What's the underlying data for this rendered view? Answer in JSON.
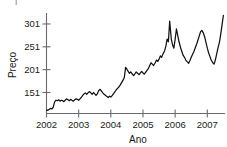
{
  "chart_data": {
    "type": "line",
    "title": "",
    "xlabel": "Ano",
    "ylabel": "Preço",
    "xlim": [
      2002.0,
      2007.55
    ],
    "ylim": [
      105,
      325
    ],
    "grid": false,
    "legend": null,
    "x_ticks": [
      2002,
      2003,
      2004,
      2005,
      2006,
      2007
    ],
    "x_tick_labels": [
      "2002",
      "2003",
      "2004",
      "2005",
      "2006",
      "2007"
    ],
    "y_ticks": [
      151,
      201,
      251,
      301
    ],
    "y_tick_labels": [
      "151",
      "201",
      "251",
      "301"
    ],
    "series": [
      {
        "name": "Preço",
        "color": "#121212",
        "marker": "none",
        "x": [
          2002.0,
          2002.04,
          2002.08,
          2002.12,
          2002.17,
          2002.21,
          2002.25,
          2002.29,
          2002.33,
          2002.38,
          2002.42,
          2002.46,
          2002.5,
          2002.54,
          2002.58,
          2002.62,
          2002.67,
          2002.71,
          2002.75,
          2002.79,
          2002.83,
          2002.88,
          2002.92,
          2002.96,
          2003.0,
          2003.04,
          2003.08,
          2003.12,
          2003.17,
          2003.21,
          2003.25,
          2003.29,
          2003.33,
          2003.38,
          2003.42,
          2003.46,
          2003.5,
          2003.54,
          2003.58,
          2003.62,
          2003.67,
          2003.71,
          2003.75,
          2003.79,
          2003.83,
          2003.88,
          2003.92,
          2003.96,
          2004.0,
          2004.04,
          2004.08,
          2004.12,
          2004.17,
          2004.21,
          2004.25,
          2004.29,
          2004.33,
          2004.38,
          2004.42,
          2004.46,
          2004.5,
          2004.54,
          2004.58,
          2004.62,
          2004.67,
          2004.71,
          2004.75,
          2004.79,
          2004.83,
          2004.88,
          2004.92,
          2004.96,
          2005.0,
          2005.04,
          2005.08,
          2005.12,
          2005.17,
          2005.21,
          2005.25,
          2005.29,
          2005.33,
          2005.38,
          2005.42,
          2005.46,
          2005.5,
          2005.54,
          2005.58,
          2005.62,
          2005.67,
          2005.71,
          2005.75,
          2005.79,
          2005.83,
          2005.88,
          2005.92,
          2005.96,
          2006.0,
          2006.04,
          2006.08,
          2006.12,
          2006.17,
          2006.21,
          2006.25,
          2006.29,
          2006.33,
          2006.38,
          2006.42,
          2006.46,
          2006.5,
          2006.54,
          2006.58,
          2006.62,
          2006.67,
          2006.71,
          2006.75,
          2006.79,
          2006.83,
          2006.88,
          2006.92,
          2006.96,
          2007.0,
          2007.04,
          2007.08,
          2007.12,
          2007.17,
          2007.21,
          2007.25,
          2007.29,
          2007.33,
          2007.38,
          2007.42,
          2007.46,
          2007.5
        ],
        "y": [
          113,
          112,
          114,
          116,
          115,
          119,
          130,
          134,
          133,
          135,
          132,
          134,
          133,
          131,
          134,
          137,
          135,
          133,
          136,
          134,
          132,
          135,
          137,
          136,
          134,
          137,
          140,
          144,
          148,
          150,
          147,
          150,
          153,
          150,
          147,
          151,
          148,
          145,
          148,
          155,
          158,
          154,
          150,
          147,
          145,
          142,
          140,
          143,
          141,
          144,
          148,
          152,
          157,
          160,
          163,
          167,
          172,
          178,
          184,
          206,
          202,
          197,
          193,
          196,
          191,
          188,
          192,
          196,
          193,
          190,
          194,
          197,
          194,
          191,
          195,
          199,
          204,
          210,
          216,
          213,
          210,
          216,
          222,
          219,
          224,
          231,
          228,
          235,
          242,
          252,
          268,
          262,
          307,
          268,
          255,
          248,
          268,
          290,
          276,
          262,
          249,
          240,
          232,
          228,
          222,
          218,
          215,
          221,
          228,
          234,
          240,
          248,
          257,
          266,
          275,
          284,
          287,
          281,
          272,
          260,
          248,
          238,
          230,
          222,
          216,
          213,
          222,
          235,
          248,
          262,
          280,
          300,
          320
        ]
      }
    ]
  },
  "artifacts": {
    "top_left_mark": true
  }
}
